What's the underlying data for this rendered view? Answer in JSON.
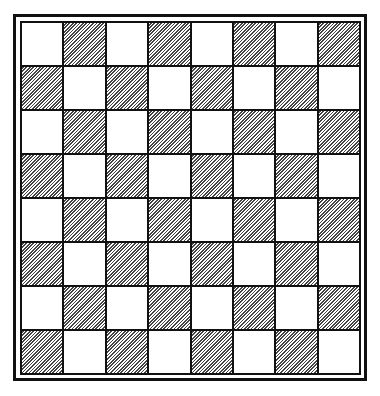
{
  "board": {
    "rows": 8,
    "cols": 8,
    "light_color": "#ffffff",
    "dark_pattern": "diagonal-hatch",
    "border_color": "#111111",
    "top_left_square": "light"
  }
}
